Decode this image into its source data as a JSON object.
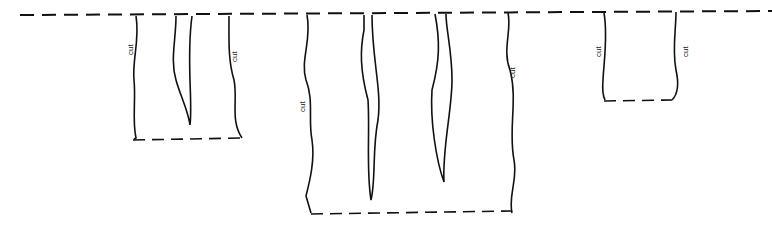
{
  "diagram": {
    "type": "paper cutting pattern",
    "labels": {
      "cut_1": "cut",
      "cut_2": "cut",
      "cut_3": "cut",
      "cut_4": "cut",
      "cut_5": "cut",
      "cut_6": "cut"
    },
    "groups": [
      {
        "name": "left-panel",
        "cut_labels": 2,
        "slits": 1
      },
      {
        "name": "middle-panel",
        "cut_labels": 2,
        "slits": 2
      },
      {
        "name": "right-panel",
        "cut_labels": 2,
        "slits": 0
      }
    ]
  }
}
